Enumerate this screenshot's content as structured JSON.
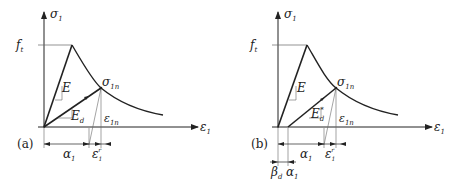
{
  "panels": [
    {
      "id": "a",
      "tag": "(a)",
      "y_axis": "σ",
      "y_axis_sub": "1",
      "x_axis": "ε",
      "x_axis_sub": "1",
      "peak_label": "f",
      "peak_label_sub": "t",
      "slope_E": "E",
      "slope_Ed": "E",
      "slope_Ed_sub": "d",
      "point_label": "σ",
      "point_label_sub": "1n",
      "strain_label": "ε",
      "strain_label_sub": "1n",
      "dim_alpha": "α",
      "dim_alpha_sub": "1",
      "dim_eps": "ε",
      "dim_eps_sub": "1",
      "dim_eps_sup": "r"
    },
    {
      "id": "b",
      "tag": "(b)",
      "y_axis": "σ",
      "y_axis_sub": "1",
      "x_axis": "ε",
      "x_axis_sub": "1",
      "peak_label": "f",
      "peak_label_sub": "t",
      "slope_E": "E",
      "slope_Ed": "E",
      "slope_Ed_sub": "d",
      "slope_Ed_sup": "*",
      "point_label": "σ",
      "point_label_sub": "1n",
      "strain_label": "ε",
      "strain_label_sub": "1n",
      "dim_alpha": "α",
      "dim_alpha_sub": "1",
      "dim_eps": "ε",
      "dim_eps_sub": "1",
      "dim_eps_sup": "r",
      "dim_beta": "β",
      "dim_beta_sub": "d",
      "dim_alpha2": "α",
      "dim_alpha2_sub": "1"
    }
  ]
}
